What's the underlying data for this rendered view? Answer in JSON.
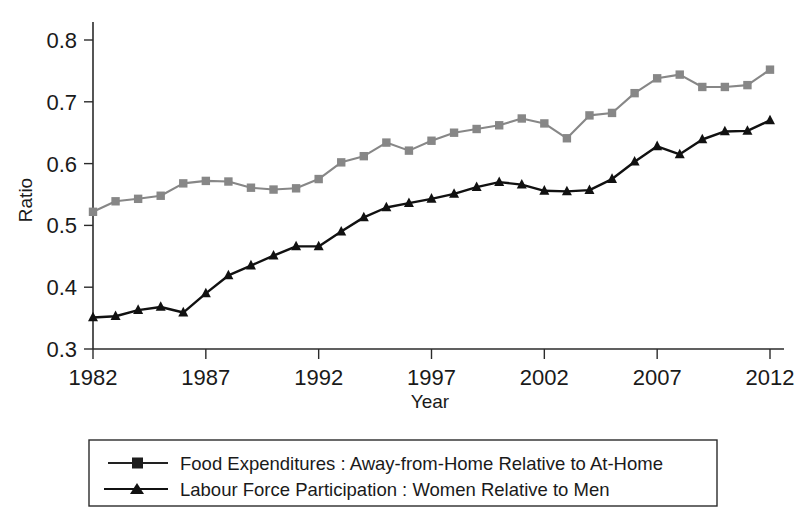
{
  "chart_data": {
    "type": "line",
    "title": "",
    "subtitle": "",
    "xlabel": "Year",
    "ylabel": "Ratio",
    "xlim": [
      1982,
      2012
    ],
    "ylim": [
      0.3,
      0.8
    ],
    "xticks": [
      1982,
      1987,
      1992,
      1997,
      2002,
      2007,
      2012
    ],
    "xticklabels": [
      "1982",
      "1987",
      "1992",
      "1997",
      "2002",
      "2007",
      "2012"
    ],
    "yticks": [
      0.3,
      0.4,
      0.5,
      0.6,
      0.7,
      0.8
    ],
    "yticklabels": [
      "0.3",
      "0.4",
      "0.5",
      "0.6",
      "0.7",
      "0.8"
    ],
    "grid": false,
    "legend_position": "below-axes",
    "x": [
      1982,
      1983,
      1984,
      1985,
      1986,
      1987,
      1988,
      1989,
      1990,
      1991,
      1992,
      1993,
      1994,
      1995,
      1996,
      1997,
      1998,
      1999,
      2000,
      2001,
      2002,
      2003,
      2004,
      2005,
      2006,
      2007,
      2008,
      2009,
      2010,
      2011,
      2012
    ],
    "series": [
      {
        "name": "Food Expenditures : Away-from-Home Relative to At-Home",
        "marker": "square",
        "color": "#878787",
        "values": [
          0.522,
          0.539,
          0.543,
          0.548,
          0.568,
          0.572,
          0.571,
          0.561,
          0.558,
          0.56,
          0.575,
          0.602,
          0.612,
          0.634,
          0.621,
          0.637,
          0.65,
          0.656,
          0.662,
          0.673,
          0.665,
          0.641,
          0.678,
          0.682,
          0.714,
          0.738,
          0.744,
          0.724,
          0.724,
          0.727,
          0.752
        ]
      },
      {
        "name": "Labour Force Participation : Women Relative to Men",
        "marker": "triangle",
        "color": "#111111",
        "values": [
          0.351,
          0.353,
          0.363,
          0.368,
          0.359,
          0.39,
          0.419,
          0.435,
          0.451,
          0.466,
          0.466,
          0.49,
          0.513,
          0.529,
          0.536,
          0.543,
          0.551,
          0.562,
          0.57,
          0.566,
          0.556,
          0.555,
          0.557,
          0.575,
          0.603,
          0.628,
          0.615,
          0.639,
          0.652,
          0.653,
          0.67
        ]
      }
    ]
  },
  "legend": {
    "entries": [
      {
        "label": "Food Expenditures : Away-from-Home Relative to At-Home",
        "marker": "square",
        "color": "#222222"
      },
      {
        "label": "Labour Force Participation : Women Relative to Men",
        "marker": "triangle",
        "color": "#111111"
      }
    ]
  },
  "colors": {
    "food_series": "#878787",
    "labour_series": "#111111",
    "axis": "#2b2b2b",
    "background": "#ffffff"
  }
}
